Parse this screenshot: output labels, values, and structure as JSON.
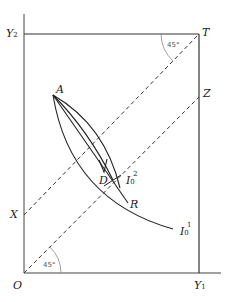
{
  "diagram": {
    "type": "edgeworth-box",
    "labels": {
      "origin": "O",
      "y2": "Y",
      "y2_sub": "2",
      "y1": "Y",
      "y1_sub": "1",
      "top_right": "T",
      "z": "Z",
      "x": "X",
      "a": "A",
      "d": "D",
      "r": "R",
      "i02": "I",
      "i02_sub": "0",
      "i02_sup": "2",
      "i01": "I",
      "i01_sub": "0",
      "i01_sup": "1"
    },
    "angles": {
      "top": "45°",
      "bottom": "45°"
    },
    "colors": {
      "line": "#333333",
      "dash": "#333333",
      "arc": "#888888"
    }
  }
}
